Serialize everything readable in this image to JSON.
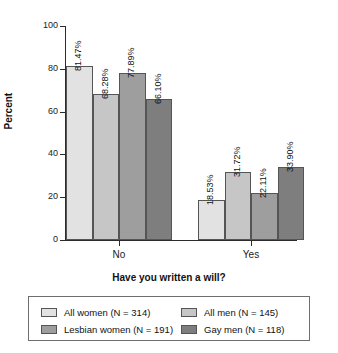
{
  "chart_data": {
    "type": "bar",
    "title": "",
    "subtitle": "",
    "xlabel": "Have you written a will?",
    "ylabel": "Percent",
    "categories": [
      "No",
      "Yes"
    ],
    "ylim": [
      0,
      100
    ],
    "yticks": [
      0,
      20,
      40,
      60,
      80,
      100
    ],
    "ytick_labels": [
      "0",
      "20",
      "40",
      "60",
      "80",
      "100"
    ],
    "grid": false,
    "legend_position": "bottom",
    "value_label_suffix": "%",
    "series": [
      {
        "name": "All women (N = 314)",
        "color": "#e2e2e2",
        "values": [
          81.47,
          68.28
        ],
        "labels": [
          "81.47%",
          "68.28%"
        ]
      },
      {
        "name": "All men (N = 145)",
        "color": "#c6c6c6",
        "values": [
          68.28,
          31.72
        ],
        "labels": [
          "68.28%",
          "31.72%"
        ]
      },
      {
        "name": "Lesbian women (N = 191)",
        "color": "#9e9e9e",
        "values": [
          77.89,
          22.11
        ],
        "labels": [
          "77.89%",
          "22.11%"
        ]
      },
      {
        "name": "Gay men (N = 118)",
        "color": "#7e7e7e",
        "values": [
          66.1,
          33.9
        ],
        "labels": [
          "66.10%",
          "33.90%"
        ]
      }
    ],
    "groups": [
      {
        "category": "No",
        "bars": [
          {
            "series": "All women (N = 314)",
            "value": 81.47,
            "label": "81.47%",
            "color": "#e2e2e2"
          },
          {
            "series": "All men (N = 145)",
            "value": 68.28,
            "label": "68.28%",
            "color": "#c6c6c6"
          },
          {
            "series": "Lesbian women (N = 191)",
            "value": 77.89,
            "label": "77.89%",
            "color": "#9e9e9e"
          },
          {
            "series": "Gay men (N = 118)",
            "value": 66.1,
            "label": "66.10%",
            "color": "#7e7e7e"
          }
        ]
      },
      {
        "category": "Yes",
        "bars": [
          {
            "series": "All women (N = 314)",
            "value": 18.53,
            "label": "18.53%",
            "color": "#e2e2e2"
          },
          {
            "series": "All men (N = 145)",
            "value": 31.72,
            "label": "31.72%",
            "color": "#c6c6c6"
          },
          {
            "series": "Lesbian women (N = 191)",
            "value": 22.11,
            "label": "22.11%",
            "color": "#9e9e9e"
          },
          {
            "series": "Gay men (N = 118)",
            "value": 33.9,
            "label": "33.90%",
            "color": "#7e7e7e"
          }
        ]
      }
    ]
  },
  "axis": {
    "y_title": "Percent",
    "x_title": "Have you written a will?",
    "y_tick_labels": [
      "100",
      "80",
      "60",
      "40",
      "20",
      "0"
    ],
    "x_tick_labels": [
      "No",
      "Yes"
    ]
  },
  "legend": {
    "entries": [
      {
        "label": "All women (N = 314)",
        "color": "#e2e2e2"
      },
      {
        "label": "All men (N = 145)",
        "color": "#c6c6c6"
      },
      {
        "label": "Lesbian women (N = 191)",
        "color": "#9e9e9e"
      },
      {
        "label": "Gay men (N = 118)",
        "color": "#7e7e7e"
      }
    ]
  }
}
